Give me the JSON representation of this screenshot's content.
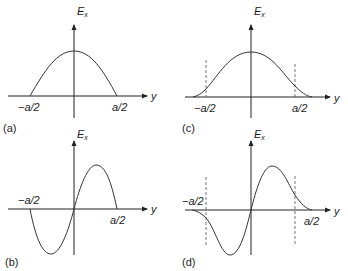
{
  "panels": {
    "a": {
      "tag": "(a)",
      "y_axis_label": "E",
      "y_axis_sub": "x",
      "x_axis_label": "y",
      "tick_left": "−a/2",
      "tick_right": "a/2",
      "curve": "half cosine, zero at ±a/2, peak at y=0"
    },
    "b": {
      "tag": "(b)",
      "y_axis_label": "E",
      "y_axis_sub": "x",
      "x_axis_label": "y",
      "tick_left": "−a/2",
      "tick_right": "a/2",
      "curve": "full sine period, zeros at −a/2, 0, a/2"
    },
    "c": {
      "tag": "(c)",
      "y_axis_label": "E",
      "y_axis_sub": "x",
      "x_axis_label": "y",
      "tick_left": "−a/2",
      "tick_right": "a/2",
      "curve": "even mode with evanescent tails beyond ±a/2 (dashed boundaries)"
    },
    "d": {
      "tag": "(d)",
      "y_axis_label": "E",
      "y_axis_sub": "x",
      "x_axis_label": "y",
      "tick_left": "−a/2",
      "tick_right": "a/2",
      "curve": "odd mode with evanescent tails beyond ±a/2 (dashed boundaries)"
    }
  }
}
